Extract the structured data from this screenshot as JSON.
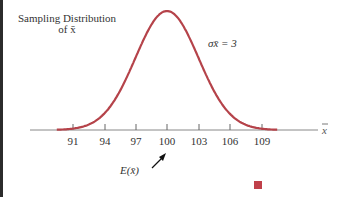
{
  "chart_data": {
    "type": "line",
    "title": "Sampling Distribution of x̄",
    "title_line1": "Sampling Distribution",
    "title_line2": "of x̄",
    "xlabel": "x̄",
    "ylabel": "",
    "annotation_sigma": "σx̄ = 3",
    "annotation_mean": "E(x̄)",
    "mean": 100,
    "sigma": 3,
    "x_ticks": [
      91,
      94,
      97,
      100,
      103,
      106,
      109
    ],
    "xlim": [
      89,
      116
    ],
    "grid": false,
    "curve_color": "#b5434a"
  },
  "labels": {
    "t0": "91",
    "t1": "94",
    "t2": "97",
    "t3": "100",
    "t4": "103",
    "t5": "106",
    "t6": "109"
  }
}
